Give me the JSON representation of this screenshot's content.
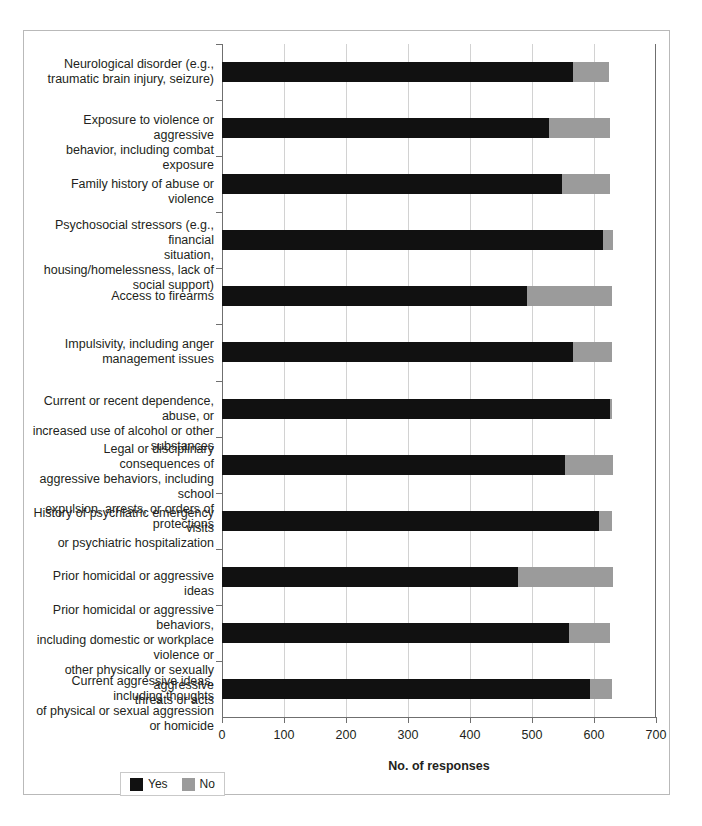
{
  "figure": {
    "bleed_through_text": "",
    "axis_color": "#6f6f6f",
    "grid_color": "#d2d2d2",
    "frame_color": "#b9b9b9"
  },
  "legend": {
    "items": [
      {
        "label": "Yes",
        "color": "#111111",
        "swatch": "yes-swatch"
      },
      {
        "label": "No",
        "color": "#9b9b9b",
        "swatch": "no-swatch"
      }
    ]
  },
  "chart_data": {
    "type": "bar",
    "orientation": "horizontal",
    "stacked": true,
    "title": "",
    "xlabel": "No. of responses",
    "ylabel": "",
    "xlim": [
      0,
      700
    ],
    "xticks": [
      0,
      100,
      200,
      300,
      400,
      500,
      600,
      700
    ],
    "xticklabels": [
      "0",
      "100",
      "200",
      "300",
      "400",
      "500",
      "600",
      "700"
    ],
    "grid": "vertical",
    "legend_position": "bottom-left",
    "colors": {
      "Yes": "#111111",
      "No": "#9b9b9b"
    },
    "categories": [
      "Neurological disorder (e.g., traumatic brain injury, seizure)",
      "Exposure to violence or aggressive behavior, including combat exposure",
      "Family history of abuse or violence",
      "Psychosocial stressors (e.g., financial situation, housing/homelessness, lack of social support)",
      "Access to firearms",
      "Impulsivity, including anger management issues",
      "Current or recent dependence, abuse, or increased use of alcohol or other substances",
      "Legal or disciplinary consequences of aggressive behaviors, including school expulsion, arrests, or orders of protections",
      "History of psychiatric emergency visits or psychiatric hospitalization",
      "Prior homicidal or aggressive ideas",
      "Prior homicidal or aggressive behaviors, including domestic or workplace violence or other physically or sexually aggressive threats or acts",
      "Current aggressive ideas, including thoughts of physical or sexual aggression or homicide"
    ],
    "category_lines": [
      [
        "Neurological disorder (e.g.,",
        "traumatic brain injury, seizure)"
      ],
      [
        "Exposure to violence or aggressive",
        "behavior, including combat exposure"
      ],
      [
        "Family history of abuse or violence"
      ],
      [
        "Psychosocial stressors (e.g., financial",
        "situation, housing/homelessness, lack of",
        "social support)"
      ],
      [
        "Access to firearms"
      ],
      [
        "Impulsivity, including anger",
        "management issues"
      ],
      [
        "Current or recent dependence, abuse, or",
        "increased use of alcohol or other substances"
      ],
      [
        "Legal or disciplinary consequences of",
        "aggressive behaviors, including school",
        "expulsion, arrests, or orders of protections"
      ],
      [
        "History of psychiatric emergency visits",
        "or psychiatric hospitalization"
      ],
      [
        "Prior homicidal or aggressive ideas"
      ],
      [
        "Prior homicidal or aggressive behaviors,",
        "including domestic or workplace violence or",
        "other physically or sexually aggressive",
        "threats or acts"
      ],
      [
        "Current aggressive ideas, including thoughts",
        "of physical or sexual aggression or homicide"
      ]
    ],
    "series": [
      {
        "name": "Yes",
        "values": [
          566,
          527,
          548,
          614,
          492,
          566,
          626,
          553,
          608,
          477,
          560,
          594
        ]
      },
      {
        "name": "No",
        "values": [
          58,
          99,
          78,
          17,
          137,
          63,
          3,
          78,
          21,
          154,
          66,
          35
        ]
      }
    ],
    "totals": [
      624,
      626,
      626,
      631,
      629,
      629,
      629,
      631,
      629,
      631,
      626,
      629
    ]
  }
}
